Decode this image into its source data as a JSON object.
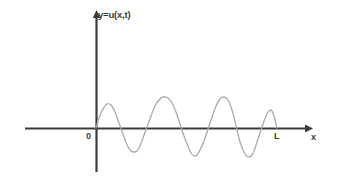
{
  "figure": {
    "background_color": "#ffffff",
    "width": 338,
    "height": 191
  },
  "labels": {
    "y_axis_title": "y=u(x,t)",
    "x_axis_title": "x",
    "origin": "0",
    "length_mark": "L"
  },
  "colors": {
    "axis": "#3b3b3b",
    "curve": "#a9a9a9",
    "text": "#3b3b3b",
    "background": "#ffffff"
  },
  "chart_data": {
    "type": "line",
    "title": "",
    "xlabel": "x",
    "ylabel": "y=u(x,t)",
    "grid": false,
    "legend": null,
    "annotations": [
      {
        "text": "0",
        "x": 0,
        "y": 0,
        "note": "origin marker just left of y-axis below x-axis"
      },
      {
        "text": "L",
        "x": 1,
        "y": 0,
        "note": "right endpoint of the string on the x-axis"
      },
      {
        "text": "y=u(x,t)",
        "x": 0,
        "y": 1,
        "note": "label at top of vertical axis"
      },
      {
        "text": "x",
        "x": 1.12,
        "y": 0,
        "note": "label at arrow tip of horizontal axis"
      }
    ],
    "axes": {
      "x_axis": {
        "pixel_y": 128,
        "pixel_x_start": 25,
        "pixel_x_end": 311,
        "arrow": "right"
      },
      "y_axis": {
        "pixel_x": 96,
        "pixel_y_top": 12,
        "pixel_y_bottom": 172,
        "arrow": "up"
      },
      "origin_pixel": [
        96,
        128
      ],
      "L_pixel": [
        277,
        128
      ],
      "xlim": [
        0,
        1
      ],
      "ylim": [
        -1,
        1
      ]
    },
    "series": [
      {
        "name": "u(x,t)",
        "color": "#a9a9a9",
        "description": "Standing-wave snapshot on a string of length L: oscillation starting at the origin, crossing zero at L, with amplitude increasing and wavelength decreasing toward L.",
        "x_pixels": [
          96,
          99,
          103,
          107,
          111,
          115,
          119,
          123,
          127,
          131,
          134,
          137,
          140,
          143,
          147,
          151,
          155,
          159,
          163,
          168,
          172,
          176,
          180,
          184,
          188,
          191,
          194,
          197,
          200,
          204,
          208,
          212,
          216,
          220,
          224,
          228,
          231,
          234,
          237,
          240,
          244,
          248,
          252,
          255,
          259,
          263,
          267,
          271,
          274,
          277
        ],
        "y_pixels": [
          128,
          118,
          109,
          104,
          105,
          112,
          123,
          134,
          145,
          151,
          152,
          151,
          146,
          138,
          127,
          116,
          106,
          100,
          97,
          98,
          103,
          112,
          124,
          136,
          146,
          153,
          156,
          155,
          150,
          141,
          129,
          117,
          106,
          99,
          97,
          100,
          107,
          117,
          130,
          142,
          152,
          157,
          155,
          148,
          136,
          124,
          114,
          110,
          116,
          128
        ]
      }
    ]
  }
}
